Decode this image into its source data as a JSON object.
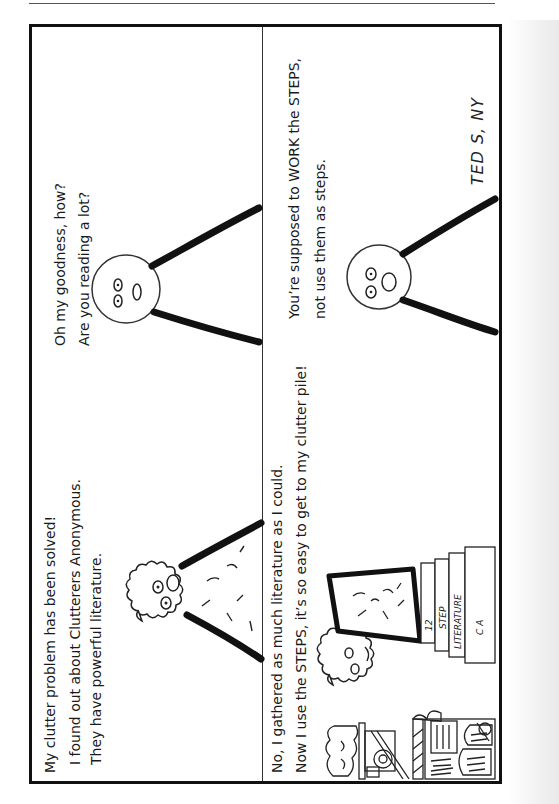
{
  "comic": {
    "orientation": "rotated 90 degrees clockwise",
    "panels": [
      {
        "id": 1,
        "lines": [
          "My clutter problem has  been solved!",
          "I found out about Clutterers Anonymous.",
          "They have powerful literature."
        ],
        "character": "curly-haired speaker"
      },
      {
        "id": 2,
        "lines": [
          "Oh my goodness, how?",
          "Are you reading a lot?"
        ],
        "character": "round-headed listener"
      },
      {
        "id": 3,
        "lines": [
          "No, I gathered as much literature as I could.",
          "Now I use the STEPS, it’s so easy to get to my clutter pile!"
        ],
        "character": "curly-haired speaker standing on stacked books",
        "book_labels": [
          "12",
          "STEP",
          "LITERATURE",
          "C A"
        ]
      },
      {
        "id": 4,
        "lines": [
          "You’re supposed to WORK the STEPS,",
          "not use them as steps."
        ],
        "character": "round-headed listener"
      }
    ],
    "signature": "TED S, NY"
  }
}
